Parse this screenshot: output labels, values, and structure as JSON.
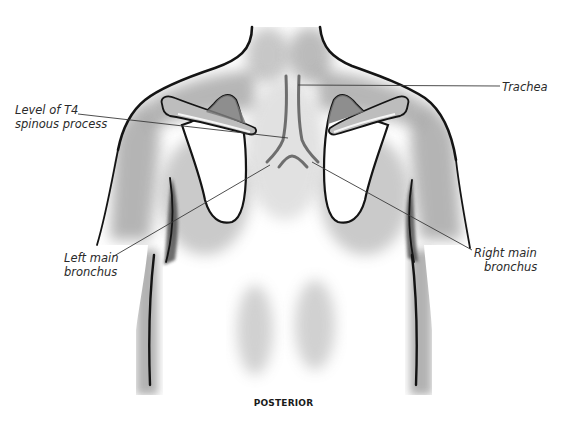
{
  "figure": {
    "view_caption": "POSTERIOR",
    "colors": {
      "background": "#ffffff",
      "outline": "#1a1a1a",
      "shading": "#8a8a8a",
      "airway": "#6e6e6e",
      "leader_line": "#3a3a3a",
      "label_text": "#2a2a2a"
    }
  },
  "labels": {
    "t4": {
      "line1": "Level of T4",
      "line2": "spinous process"
    },
    "trachea": {
      "line1": "Trachea"
    },
    "left_bronchus": {
      "line1": "Left main",
      "line2": "bronchus"
    },
    "right_bronchus": {
      "line1": "Right main",
      "line2": "bronchus"
    }
  }
}
